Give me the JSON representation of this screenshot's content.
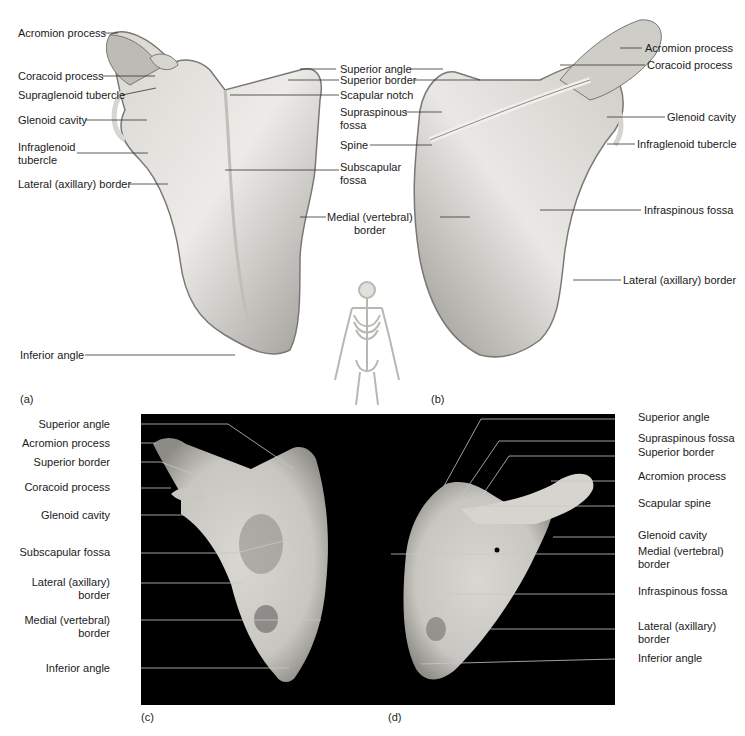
{
  "figure": {
    "captions": {
      "a": "(a)",
      "b": "(b)",
      "c": "(c)",
      "d": "(d)"
    },
    "panel_a": {
      "view": "anterior illustration",
      "labels": [
        {
          "id": "acromion",
          "text": "Acromion process"
        },
        {
          "id": "coracoid",
          "text": "Coracoid process"
        },
        {
          "id": "supraglenoid",
          "text": "Supraglenoid tubercle"
        },
        {
          "id": "glenoid",
          "text": "Glenoid cavity"
        },
        {
          "id": "infraglenoid",
          "text": "Infraglenoid\ntubercle"
        },
        {
          "id": "lateral",
          "text": "Lateral (axillary) border"
        },
        {
          "id": "inferior",
          "text": "Inferior angle"
        }
      ]
    },
    "center_labels": [
      {
        "id": "superior_angle",
        "text": "Superior angle"
      },
      {
        "id": "superior_border",
        "text": "Superior border"
      },
      {
        "id": "scapular_notch",
        "text": "Scapular notch"
      },
      {
        "id": "supraspinous",
        "text": "Supraspinous\nfossa"
      },
      {
        "id": "spine",
        "text": "Spine"
      },
      {
        "id": "subscapular",
        "text": "Subscapular\nfossa"
      },
      {
        "id": "medial",
        "text": "Medial (vertebral)\nborder"
      }
    ],
    "panel_b": {
      "view": "posterior illustration",
      "labels": [
        {
          "id": "acromion",
          "text": "Acromion process"
        },
        {
          "id": "coracoid",
          "text": "Coracoid process"
        },
        {
          "id": "glenoid",
          "text": "Glenoid cavity"
        },
        {
          "id": "infraglenoid",
          "text": "Infraglenoid tubercle"
        },
        {
          "id": "infraspinous",
          "text": "Infraspinous fossa"
        },
        {
          "id": "lateral",
          "text": "Lateral (axillary) border"
        }
      ]
    },
    "panel_c": {
      "view": "anterior photograph",
      "labels": [
        {
          "id": "superior_angle",
          "text": "Superior angle"
        },
        {
          "id": "acromion",
          "text": "Acromion process"
        },
        {
          "id": "superior_border",
          "text": "Superior border"
        },
        {
          "id": "coracoid",
          "text": "Coracoid process"
        },
        {
          "id": "glenoid",
          "text": "Glenoid cavity"
        },
        {
          "id": "subscapular",
          "text": "Subscapular fossa"
        },
        {
          "id": "lateral",
          "text": "Lateral (axillary)\nborder"
        },
        {
          "id": "medial",
          "text": "Medial (vertebral)\nborder"
        },
        {
          "id": "inferior",
          "text": "Inferior angle"
        }
      ]
    },
    "panel_d": {
      "view": "posterior photograph",
      "labels": [
        {
          "id": "superior_angle",
          "text": "Superior angle"
        },
        {
          "id": "supraspinous",
          "text": "Supraspinous fossa"
        },
        {
          "id": "superior_border",
          "text": "Superior border"
        },
        {
          "id": "acromion",
          "text": "Acromion process"
        },
        {
          "id": "spine",
          "text": "Scapular spine"
        },
        {
          "id": "glenoid",
          "text": "Glenoid cavity"
        },
        {
          "id": "medial",
          "text": "Medial (vertebral)\nborder"
        },
        {
          "id": "infraspinous",
          "text": "Infraspinous fossa"
        },
        {
          "id": "lateral",
          "text": "Lateral (axillary)\nborder"
        },
        {
          "id": "inferior",
          "text": "Inferior angle"
        }
      ]
    },
    "colors": {
      "bone_light": "#e4e2dc",
      "bone_shade": "#a9a7a1",
      "bone_dark": "#6e6c68",
      "photo_bg": "#000000",
      "leader": "#333333"
    }
  }
}
